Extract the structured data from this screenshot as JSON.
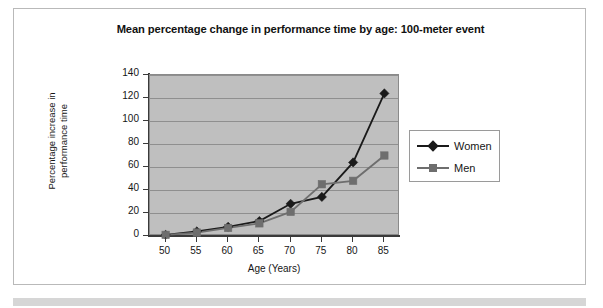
{
  "chart_data": {
    "type": "line",
    "title": "Mean percentage change in performance time by age: 100-meter event",
    "xlabel": "Age (Years)",
    "ylabel": "Percentage increase in performance time",
    "ylabel_line1": "Percentage increase in",
    "ylabel_line2": "performance time",
    "categories": [
      50,
      55,
      60,
      65,
      70,
      75,
      80,
      85
    ],
    "x_tick_labels": [
      "50",
      "55",
      "60",
      "65",
      "70",
      "75",
      "80",
      "85"
    ],
    "y_tick_labels": [
      "0",
      "20",
      "40",
      "60",
      "80",
      "100",
      "120",
      "140"
    ],
    "y_ticks": [
      0,
      20,
      40,
      60,
      80,
      100,
      120,
      140
    ],
    "ylim": [
      0,
      140
    ],
    "xlim": [
      47.5,
      87.5
    ],
    "grid": "horizontal",
    "legend_position": "right",
    "plot_background": "#bfbfbf",
    "series": [
      {
        "name": "Women",
        "marker": "diamond",
        "color": "#1a1a1a",
        "values": [
          1,
          4,
          8,
          13,
          28,
          34,
          64,
          124
        ]
      },
      {
        "name": "Men",
        "marker": "square",
        "color": "#6e6e6e",
        "values": [
          1,
          3,
          7,
          11,
          21,
          45,
          48,
          70
        ]
      }
    ]
  },
  "legend": {
    "items": [
      {
        "label": "Women"
      },
      {
        "label": "Men"
      }
    ]
  }
}
